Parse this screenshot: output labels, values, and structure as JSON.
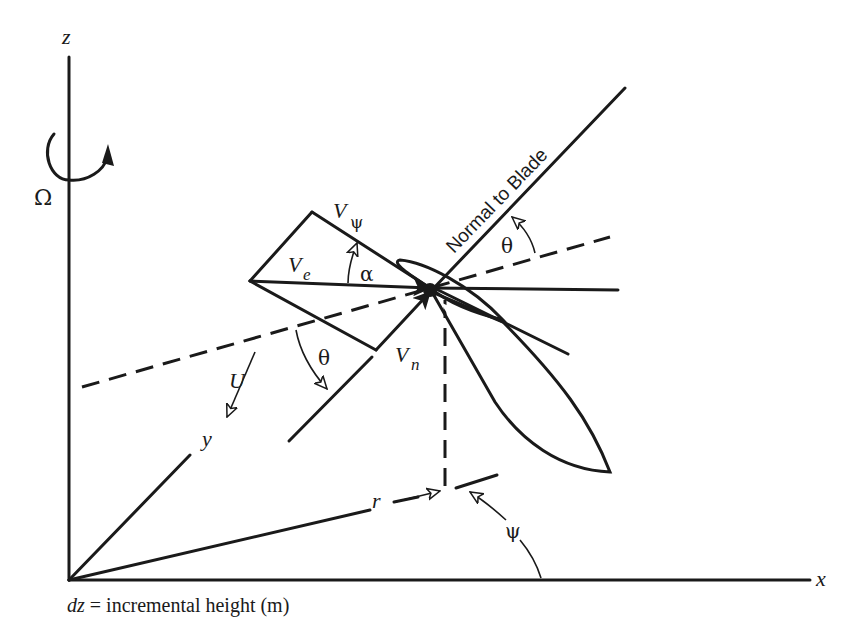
{
  "diagram": {
    "axes": {
      "z": "z",
      "x": "x",
      "y": "y"
    },
    "rotation_symbol": "Ω",
    "labels": {
      "v_psi_main": "V",
      "v_psi_sub": "ψ",
      "v_e_main": "V",
      "v_e_sub": "e",
      "v_n_main": "V",
      "v_n_sub": "n",
      "alpha": "α",
      "theta_upper": "θ",
      "theta_lower": "θ",
      "u": "U",
      "r": "r",
      "psi": "ψ",
      "normal_to_blade": "Normal to Blade"
    },
    "caption": {
      "variable": "dz",
      "text": " = incremental height (m)"
    }
  }
}
